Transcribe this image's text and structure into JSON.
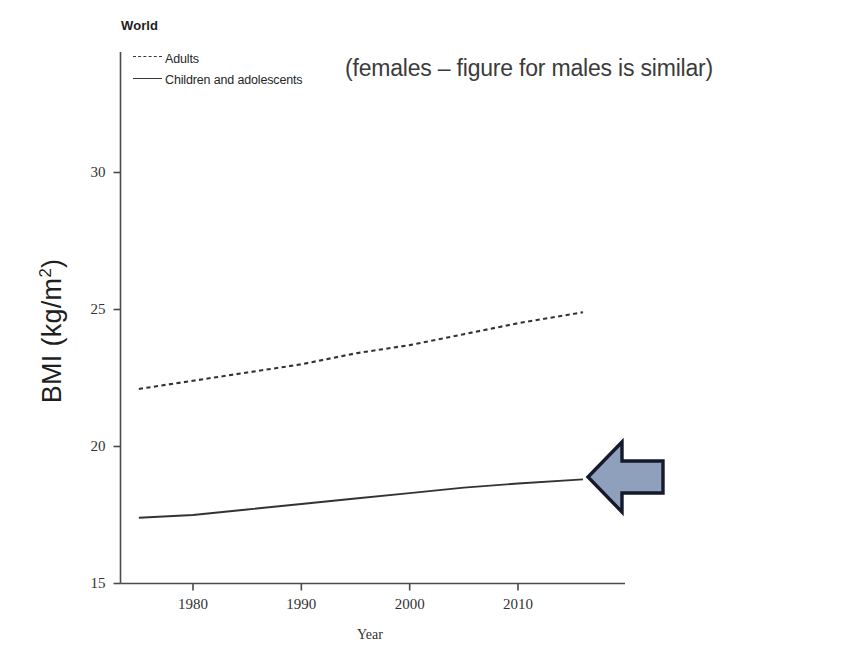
{
  "figure": {
    "panel_title": "World",
    "annotation": "(females – figure for males is similar)",
    "axis_line_color": "#4a4a4a",
    "series_color": "#333333"
  },
  "legend": {
    "items": [
      {
        "label": "Adults",
        "style": "dashed",
        "key_name": "legend-key-adults"
      },
      {
        "label": "Children and adolescents",
        "style": "solid",
        "key_name": "legend-key-children"
      }
    ]
  },
  "axes": {
    "y_title_text": "BMI (kg/m",
    "y_title_sup": "2",
    "y_title_tail": ")",
    "x_title": "Year"
  },
  "arrow": {
    "name": "callout-arrow-left",
    "direction": "left",
    "fill": "#8fa0bc",
    "stroke": "#15192b",
    "points_at_series": "Children and adolescents",
    "points_at_year": 2016
  },
  "chart_data": {
    "type": "line",
    "title": "World",
    "xlabel": "Year",
    "ylabel": "BMI (kg/m2)",
    "xlim": [
      1975,
      2018
    ],
    "ylim": [
      15,
      33
    ],
    "grid": false,
    "legend_position": "top-left",
    "yticks": [
      15,
      20,
      25,
      30
    ],
    "ytick_labels": [
      "15",
      "20",
      "25",
      "30"
    ],
    "xticks": [
      1980,
      1990,
      2000,
      2010
    ],
    "xtick_labels": [
      "1980",
      "1990",
      "2000",
      "2010"
    ],
    "annotations": [
      "(females – figure for males is similar)"
    ],
    "series": [
      {
        "name": "Adults",
        "style": "dashed",
        "x": [
          1975,
          1980,
          1985,
          1990,
          1995,
          2000,
          2005,
          2010,
          2016
        ],
        "values": [
          22.1,
          22.4,
          22.7,
          23.0,
          23.4,
          23.7,
          24.1,
          24.5,
          24.9
        ]
      },
      {
        "name": "Children and adolescents",
        "style": "solid",
        "x": [
          1975,
          1980,
          1985,
          1990,
          1995,
          2000,
          2005,
          2010,
          2016
        ],
        "values": [
          17.4,
          17.5,
          17.7,
          17.9,
          18.1,
          18.3,
          18.5,
          18.65,
          18.8
        ]
      }
    ]
  }
}
